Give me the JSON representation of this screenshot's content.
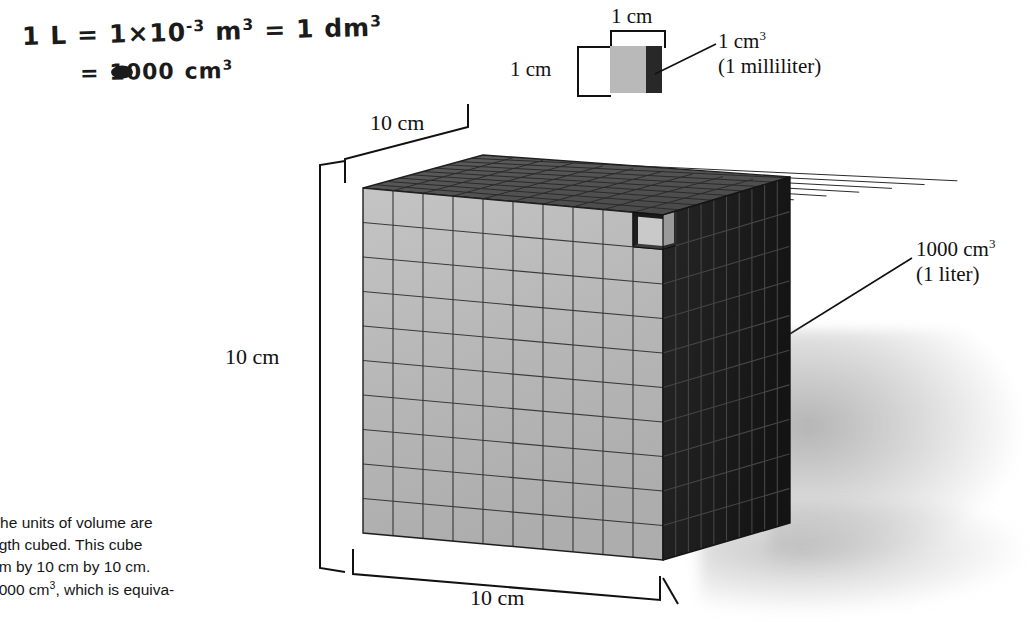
{
  "figure": {
    "type": "textbook-figure-with-handwritten-annotation",
    "background_color": "#ffffff"
  },
  "handwriting": {
    "line1_part1": "1 L",
    "line1_eq1": "=",
    "line1_part2": "1×10",
    "line1_exp2": "-3",
    "line1_unit2": "m",
    "line1_unit2_exp": "3",
    "line1_eq2": "=",
    "line1_part3": "1 dm",
    "line1_part3_exp": "3",
    "line2_eq": "=",
    "line2_value": "1000",
    "line2_unit": "cm",
    "line2_unit_exp": "3",
    "ink_color": "#1b1b1b"
  },
  "small_cube": {
    "width_label": "1 cm",
    "height_label": "1 cm",
    "callout_line1": "1 cm",
    "callout_line1_exp": "3",
    "callout_line2": "(1 milliliter)",
    "front_face_color": "#b9b9b9",
    "right_face_color": "#282828"
  },
  "big_cube": {
    "top_label": "10 cm",
    "left_label": "10 cm",
    "bottom_label": "10 cm",
    "callout_line1": "1000 cm",
    "callout_line1_exp": "3",
    "callout_line2": "(1 liter)",
    "divisions_per_edge": 10,
    "front_face_color": "#b8b8b8",
    "right_face_color": "#1f1f1f",
    "top_face_color": "#575757",
    "grid_line_color": "#3a3a3a"
  },
  "caption": {
    "figure_number": "5",
    "line1": "The units of volume are",
    "line2": "length cubed. This cube",
    "line3": "0 cm by 10 cm by 10 cm.",
    "line4_a": "s 1000 cm",
    "line4_exp": "3",
    "line4_b": ", which is equiva-"
  }
}
